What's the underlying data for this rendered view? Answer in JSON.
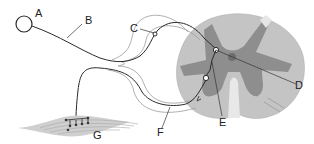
{
  "diagram": {
    "labels": {
      "A": "A",
      "B": "B",
      "C": "C",
      "D": "D",
      "E": "E",
      "F": "F",
      "G": "G"
    },
    "colors": {
      "white_matter": "#c4c4c4",
      "grey_matter": "#8e8e8e",
      "central_canal": "#6e6e6e",
      "nerve_line": "#2a2a2a",
      "sheath_line": "#9a9a9a",
      "muscle": "#cfcfcf"
    }
  }
}
